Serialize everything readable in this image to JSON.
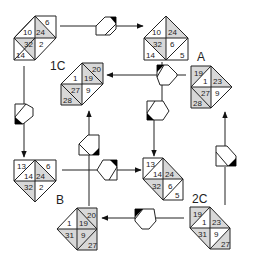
{
  "colors": {
    "line": "#222222",
    "shade": "#d8d8d8",
    "background": "#ffffff",
    "marker": "#000000"
  },
  "labels": {
    "a": "A",
    "b": "B",
    "c1": "1C",
    "c2": "2C"
  },
  "tiles": {
    "top_left": {
      "cells": [
        "6",
        "10",
        "24",
        "32",
        "2",
        "14"
      ]
    },
    "top_right": {
      "cells": [
        "10",
        "24",
        "32",
        "6",
        "14",
        "5"
      ]
    },
    "c1": {
      "label": "1C",
      "cells": [
        "20",
        "1",
        "19",
        "27",
        "9",
        "28"
      ]
    },
    "a": {
      "label": "A",
      "cells": [
        "19",
        "1",
        "23",
        "27",
        "9",
        "28"
      ]
    },
    "bottom_left": {
      "cells": [
        "13",
        "6",
        "14",
        "24",
        "32",
        "2"
      ]
    },
    "center": {
      "cells": [
        "13",
        "14",
        "24",
        "32",
        "6",
        "5"
      ]
    },
    "b": {
      "label": "B",
      "cells": [
        "20",
        "1",
        "19",
        "31",
        "9",
        "27"
      ]
    },
    "c2": {
      "label": "2C",
      "cells": [
        "19",
        "1",
        "23",
        "31",
        "9",
        "27"
      ]
    }
  },
  "connectors": [
    {
      "name": "top-connector",
      "from": "top_left",
      "to": "top_right"
    },
    {
      "name": "a-to-1c-connector",
      "from": "a",
      "to": "c1"
    },
    {
      "name": "top-right-down-connector",
      "from": "top_right",
      "to": "center"
    },
    {
      "name": "left-down-connector",
      "from": "top_left",
      "to": "bottom_left"
    },
    {
      "name": "bl-to-center-connector",
      "from": "bottom_left",
      "to": "center"
    },
    {
      "name": "b-up-to-1c-connector",
      "from": "b",
      "to": "c1"
    },
    {
      "name": "2c-to-b-connector",
      "from": "c2",
      "to": "b"
    },
    {
      "name": "2c-up-to-a-connector",
      "from": "c2",
      "to": "a"
    }
  ]
}
